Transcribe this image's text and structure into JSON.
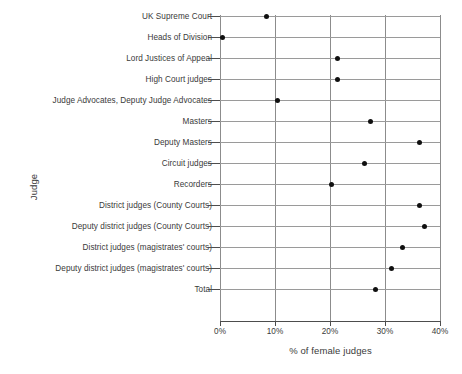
{
  "chart_data": {
    "type": "scatter",
    "title": "",
    "xlabel": "% of female judges",
    "ylabel": "Judge",
    "orientation": "horizontal",
    "xlim": [
      0,
      40
    ],
    "xticks": [
      0,
      10,
      20,
      30,
      40
    ],
    "xtick_labels": [
      "0%",
      "10%",
      "20%",
      "30%",
      "40%"
    ],
    "grid": true,
    "legend": null,
    "marker": "filled-circle",
    "marker_color": "#101010",
    "grid_color": "#9a9a9a",
    "axis_color": "#4d4d4d",
    "background": "#ffffff",
    "categories": [
      "UK Supreme Court",
      "Heads of Division",
      "Lord Justices of Appeal",
      "High Court judges",
      "Judge Advocates, Deputy Judge Advocates",
      "Masters",
      "Deputy Masters",
      "Circuit judges",
      "Recorders",
      "District judges (County Courts)",
      "Deputy district judges (County Courts)",
      "District judges (magistrates' courts)",
      "Deputy district judges (magistrates' courts)",
      "Total"
    ],
    "values": [
      8.4,
      0.4,
      21.3,
      21.3,
      10.5,
      27.3,
      36.3,
      26.3,
      20.3,
      36.2,
      37.1,
      33.2,
      31.2,
      28.3
    ]
  }
}
